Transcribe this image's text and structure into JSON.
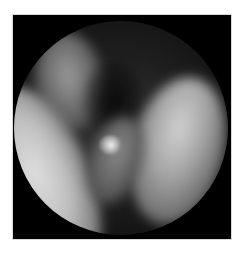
{
  "image": {
    "kind": "endoscopic-view",
    "color_mode": "grayscale",
    "colors": {
      "page_background": "#ffffff",
      "frame_background": "#000000",
      "tissue_highlight": "#e0e0e0",
      "tissue_shadow": "#1e1e1e"
    },
    "regions": [
      {
        "name": "left-fold",
        "description": "bright curved tissue fold on left"
      },
      {
        "name": "upper-left-fold",
        "description": "dimmer tissue fold at upper left"
      },
      {
        "name": "right-fold",
        "description": "large oval tissue fold on right"
      },
      {
        "name": "central-fold",
        "description": "mid-tone tissue between folds"
      },
      {
        "name": "central-lesion",
        "description": "small bright irregular lesion with specular highlights at center"
      }
    ]
  }
}
